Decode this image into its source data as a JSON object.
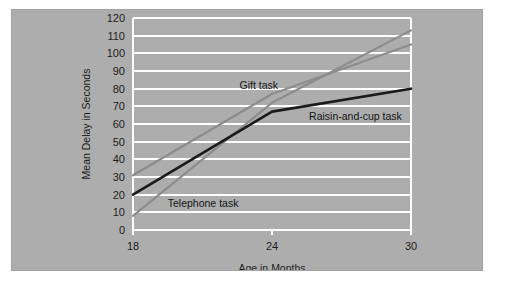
{
  "card": {
    "background_color": "#adadad"
  },
  "chart_data": {
    "type": "line",
    "title": "",
    "xlabel": "Age in Months",
    "ylabel": "Mean Delay in Seconds",
    "x": [
      18,
      24,
      30
    ],
    "xtick_labels": [
      "18",
      "24",
      "30"
    ],
    "xlim": [
      18,
      30
    ],
    "ylim": [
      0,
      120
    ],
    "ytick_labels": [
      "0",
      "10",
      "20",
      "30",
      "40",
      "50",
      "60",
      "70",
      "80",
      "90",
      "100",
      "110",
      "120"
    ],
    "yticks": [
      0,
      10,
      20,
      30,
      40,
      50,
      60,
      70,
      80,
      90,
      100,
      110,
      120
    ],
    "grid": true,
    "grid_color": "#ffffff",
    "plot_border_color": "#ffffff",
    "legend_position": "inline-annotations",
    "series": [
      {
        "name": "Gift task",
        "label": "Gift task",
        "color": "#8c8c8c",
        "values": [
          8,
          72,
          113
        ],
        "label_x": 22.6,
        "label_y": 80
      },
      {
        "name": "Telephone task",
        "label": "Telephone task",
        "color": "#8c8c8c",
        "values": [
          31,
          77,
          105
        ],
        "label_x": 19.5,
        "label_y": 13
      },
      {
        "name": "Raisin-and-cup task",
        "label": "Raisin-and-cup task",
        "color": "#1a1a1a",
        "values": [
          20,
          67,
          80
        ],
        "label_x": 25.6,
        "label_y": 62
      }
    ]
  }
}
